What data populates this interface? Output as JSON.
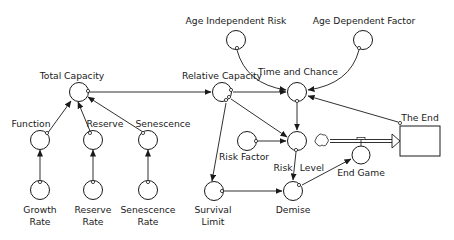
{
  "diagram": {
    "type": "stock-and-flow",
    "nodes": {
      "age_independent_risk": "Age Independent Risk",
      "age_dependent_factor": "Age Dependent Factor",
      "total_capacity": "Total Capacity",
      "relative_capacity": "Relative Capacity",
      "time_and_chance": "Time and Chance",
      "function": "Function",
      "reserve": "Reserve",
      "senescence": "Senescence",
      "growth_rate_1": "Growth",
      "growth_rate_2": "Rate",
      "reserve_rate_1": "Reserve",
      "reserve_rate_2": "Rate",
      "senescence_rate_1": "Senescence",
      "senescence_rate_2": "Rate",
      "risk_factor": "Risk Factor",
      "risk_level_1": "Risk",
      "risk_level_2": "Level",
      "end_game": "End Game",
      "the_end": "The End",
      "survival_limit_1": "Survival",
      "survival_limit_2": "Limit",
      "demise": "Demise"
    },
    "links": [
      {
        "from": "Function",
        "to": "Total Capacity"
      },
      {
        "from": "Reserve",
        "to": "Total Capacity"
      },
      {
        "from": "Senescence",
        "to": "Total Capacity"
      },
      {
        "from": "Growth Rate",
        "to": "Function"
      },
      {
        "from": "Reserve Rate",
        "to": "Reserve"
      },
      {
        "from": "Senescence Rate",
        "to": "Senescence"
      },
      {
        "from": "Total Capacity",
        "to": "Relative Capacity"
      },
      {
        "from": "Relative Capacity",
        "to": "Time and Chance"
      },
      {
        "from": "Relative Capacity",
        "to": "Risk Level"
      },
      {
        "from": "Relative Capacity",
        "to": "Survival Limit"
      },
      {
        "from": "Age Independent Risk",
        "to": "Time and Chance"
      },
      {
        "from": "Age Dependent Factor",
        "to": "Time and Chance"
      },
      {
        "from": "The End",
        "to": "Time and Chance"
      },
      {
        "from": "Time and Chance",
        "to": "Risk Level"
      },
      {
        "from": "Risk Factor",
        "to": "Risk Level"
      },
      {
        "from": "Risk Level",
        "to": "Demise"
      },
      {
        "from": "Survival Limit",
        "to": "Demise"
      },
      {
        "from": "Demise",
        "to": "End Game"
      },
      {
        "from": "End Game",
        "to": "The End",
        "kind": "flow"
      }
    ]
  }
}
